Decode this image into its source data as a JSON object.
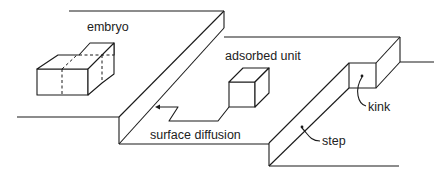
{
  "diagram": {
    "type": "crystal-growth-surface-schematic",
    "labels": {
      "embryo": "embryo",
      "adsorbed_unit": "adsorbed unit",
      "surface_diffusion": "surface diffusion",
      "kink": "kink",
      "step": "step"
    },
    "colors": {
      "line": "#1a1a1a",
      "text": "#222222",
      "background": "#ffffff"
    }
  }
}
